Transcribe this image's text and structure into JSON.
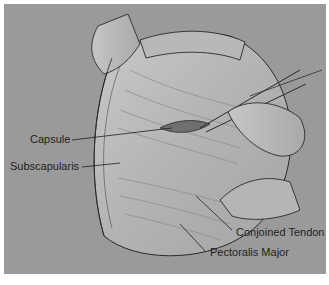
{
  "figure": {
    "labels": {
      "capsule": "Capsule",
      "subscapularis": "Subscapularis",
      "conjoined_tendon": "Conjoined Tendon",
      "pectoralis_major": "Pectoralis Major"
    }
  },
  "colors": {
    "background": "#9a9a9a",
    "tissue_light": "#c4c4c4",
    "tissue_mid": "#acacac",
    "line": "#2a2a2a",
    "text": "#1e1e1e"
  }
}
